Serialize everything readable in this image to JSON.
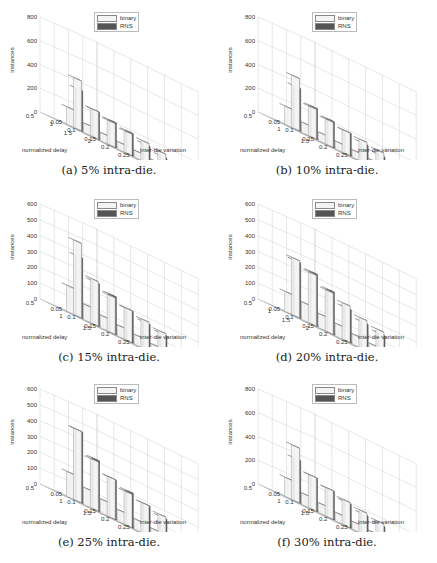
{
  "legend": {
    "series_a": "binary",
    "series_b": "RNS"
  },
  "colors": {
    "binary": "#f4f4f4",
    "rns": "#555555",
    "grid": "#cfcfcf",
    "floor": "#bdbdbd"
  },
  "axes": {
    "zlabel": "instances",
    "ylabel": "normalized delay",
    "xlabel": "inter-die variation",
    "x_ticks": [
      "0.05",
      "0.1",
      "0.15",
      "0.2",
      "0.25",
      "0.3"
    ]
  },
  "panels": [
    {
      "caption": "(a) 5% intra-die.",
      "z_ticks": [
        "0",
        "200",
        "400",
        "600",
        "800"
      ],
      "zmax": 800,
      "y_ticks": [
        "2",
        "1.5",
        "1",
        "0.5"
      ]
    },
    {
      "caption": "(b) 10% intra-die.",
      "z_ticks": [
        "0",
        "200",
        "400",
        "600",
        "800"
      ],
      "zmax": 800,
      "y_ticks": [
        "1.5",
        "1",
        "0.5"
      ]
    },
    {
      "caption": "(c) 15% intra-die.",
      "z_ticks": [
        "0",
        "100",
        "200",
        "300",
        "400",
        "500",
        "600"
      ],
      "zmax": 600,
      "y_ticks": [
        "1.5",
        "1",
        "0.5"
      ]
    },
    {
      "caption": "(d) 20% intra-die.",
      "z_ticks": [
        "0",
        "100",
        "200",
        "300",
        "400",
        "500",
        "600"
      ],
      "zmax": 600,
      "y_ticks": [
        "2",
        "1.5",
        "1",
        "0.5"
      ]
    },
    {
      "caption": "(e) 25% intra-die.",
      "z_ticks": [
        "0",
        "100",
        "200",
        "300",
        "400",
        "500",
        "600"
      ],
      "zmax": 600,
      "y_ticks": [
        "1.5",
        "1",
        "0.5"
      ]
    },
    {
      "caption": "(f) 30% intra-die.",
      "z_ticks": [
        "0",
        "200",
        "400",
        "600",
        "800"
      ],
      "zmax": 800,
      "y_ticks": [
        "1.5",
        "1",
        "0.5"
      ]
    }
  ],
  "chart_data": [
    {
      "type": "bar",
      "title": "(a) 5% intra-die.",
      "xlabel": "inter-die variation",
      "ylabel": "normalized delay",
      "zlabel": "instances",
      "zlim": [
        0,
        800
      ],
      "categories": [
        "0.05",
        "0.1",
        "0.15",
        "0.2",
        "0.25",
        "0.3"
      ],
      "series": [
        {
          "name": "binary",
          "values": [
            420,
            230,
            200,
            180,
            170,
            150
          ]
        },
        {
          "name": "RNS",
          "values": [
            340,
            230,
            210,
            190,
            150,
            120
          ]
        }
      ]
    },
    {
      "type": "bar",
      "title": "(b) 10% intra-die.",
      "xlabel": "inter-die variation",
      "ylabel": "normalized delay",
      "zlabel": "instances",
      "zlim": [
        0,
        800
      ],
      "categories": [
        "0.05",
        "0.1",
        "0.15",
        "0.2",
        "0.25",
        "0.3"
      ],
      "series": [
        {
          "name": "binary",
          "values": [
            440,
            250,
            210,
            190,
            180,
            160
          ]
        },
        {
          "name": "RNS",
          "values": [
            360,
            260,
            220,
            190,
            160,
            130
          ]
        }
      ]
    },
    {
      "type": "bar",
      "title": "(c) 15% intra-die.",
      "xlabel": "inter-die variation",
      "ylabel": "normalized delay",
      "zlabel": "instances",
      "zlim": [
        0,
        600
      ],
      "categories": [
        "0.05",
        "0.1",
        "0.15",
        "0.2",
        "0.25",
        "0.3"
      ],
      "series": [
        {
          "name": "binary",
          "values": [
            470,
            280,
            230,
            200,
            180,
            160
          ]
        },
        {
          "name": "RNS",
          "values": [
            380,
            270,
            240,
            200,
            170,
            150
          ]
        }
      ]
    },
    {
      "type": "bar",
      "title": "(d) 20% intra-die.",
      "xlabel": "inter-die variation",
      "ylabel": "normalized delay",
      "zlabel": "instances",
      "zlim": [
        0,
        600
      ],
      "categories": [
        "0.05",
        "0.1",
        "0.15",
        "0.2",
        "0.25",
        "0.3"
      ],
      "series": [
        {
          "name": "binary",
          "values": [
            360,
            320,
            260,
            230,
            190,
            170
          ]
        },
        {
          "name": "RNS",
          "values": [
            350,
            330,
            270,
            210,
            170,
            150
          ]
        }
      ]
    },
    {
      "type": "bar",
      "title": "(e) 25% intra-die.",
      "xlabel": "inter-die variation",
      "ylabel": "normalized delay",
      "zlabel": "instances",
      "zlim": [
        0,
        600
      ],
      "categories": [
        "0.05",
        "0.1",
        "0.15",
        "0.2",
        "0.25",
        "0.3"
      ],
      "series": [
        {
          "name": "binary",
          "values": [
            450,
            310,
            250,
            210,
            190,
            170
          ]
        },
        {
          "name": "RNS",
          "values": [
            450,
            320,
            250,
            220,
            190,
            160
          ]
        }
      ]
    },
    {
      "type": "bar",
      "title": "(f) 30% intra-die.",
      "xlabel": "inter-die variation",
      "ylabel": "normalized delay",
      "zlabel": "instances",
      "zlim": [
        0,
        800
      ],
      "categories": [
        "0.05",
        "0.1",
        "0.15",
        "0.2",
        "0.25",
        "0.3"
      ],
      "series": [
        {
          "name": "binary",
          "values": [
            460,
            280,
            240,
            210,
            190,
            170
          ]
        },
        {
          "name": "RNS",
          "values": [
            360,
            280,
            240,
            200,
            170,
            150
          ]
        }
      ]
    }
  ]
}
